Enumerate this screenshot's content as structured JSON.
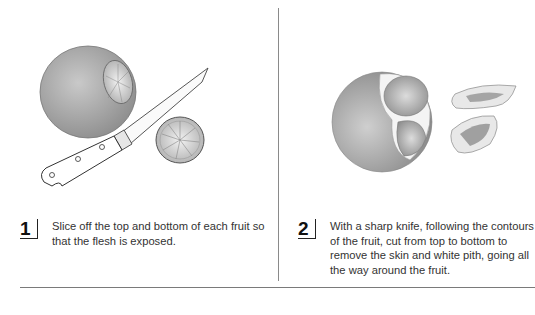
{
  "steps": [
    {
      "number": "1",
      "text": "Slice off the top and bottom of each fruit so that the flesh is exposed.",
      "illustration": "fruit-with-knife-and-slice"
    },
    {
      "number": "2",
      "text": "With a sharp knife, following the contours of the fruit, cut from top to bottom to remove the skin and white pith, going all the way around the fruit.",
      "illustration": "partially-peeled-fruit-with-peels"
    }
  ],
  "colors": {
    "background": "#ffffff",
    "text": "#333333",
    "divider": "#8a8a8a"
  }
}
